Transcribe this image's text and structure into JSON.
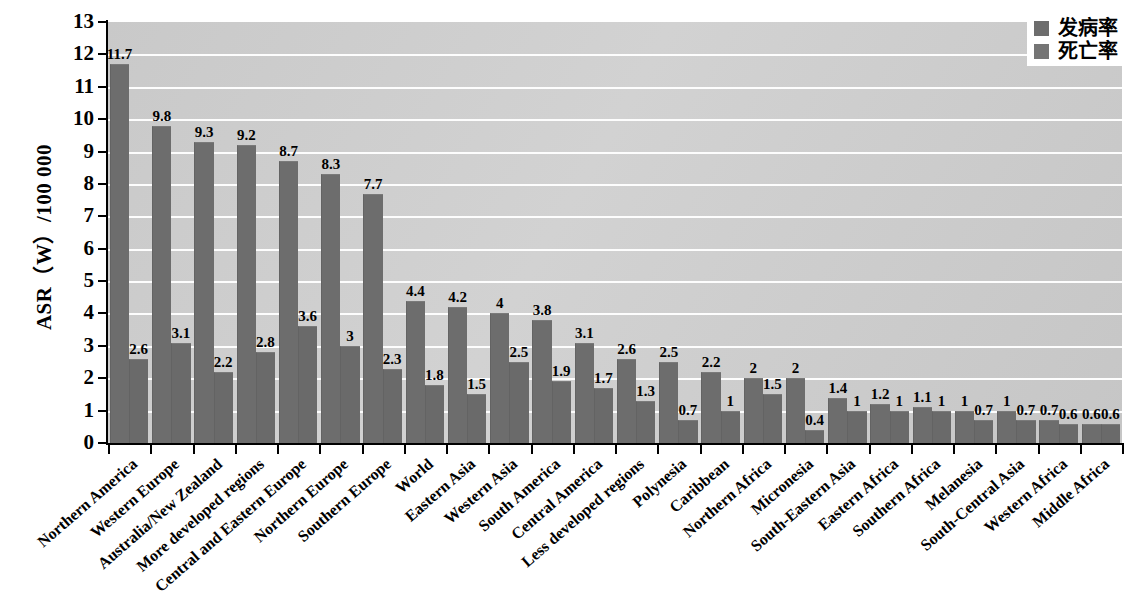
{
  "chart_data": {
    "type": "bar",
    "title": "",
    "xlabel": "",
    "ylabel": "ASR（W）/100 000",
    "ylim": [
      0,
      13
    ],
    "ytick_step": 1,
    "yticks": [
      0,
      1,
      2,
      3,
      4,
      5,
      6,
      7,
      8,
      9,
      10,
      11,
      12,
      13
    ],
    "grid": true,
    "legend_position": "top-right",
    "categories": [
      "Northern America",
      "Western Europe",
      "Australia/New Zealand",
      "More developed regions",
      "Central and Eastern Europe",
      "Northern Europe",
      "Southern Europe",
      "World",
      "Eastern Asia",
      "Western Asia",
      "South America",
      "Central America",
      "Less developed regions",
      "Polynesia",
      "Caribbean",
      "Northern Africa",
      "Micronesia",
      "South-Eastern Asia",
      "Eastern Africa",
      "Southern Africa",
      "Melanesia",
      "South-Central Asia",
      "Western Africa",
      "Middle Africa"
    ],
    "series": [
      {
        "name": "发病率",
        "color": "#6d6d6d",
        "values": [
          11.7,
          9.8,
          9.3,
          9.2,
          8.7,
          8.3,
          7.7,
          4.4,
          4.2,
          4,
          3.8,
          3.1,
          2.6,
          2.5,
          2.2,
          2,
          2,
          1.4,
          1.2,
          1.1,
          1,
          1,
          0.7,
          0.6
        ],
        "labels": [
          "11.7",
          "9.8",
          "9.3",
          "9.2",
          "8.7",
          "8.3",
          "7.7",
          "4.4",
          "4.2",
          "4",
          "3.8",
          "3.1",
          "2.6",
          "2.5",
          "2.2",
          "2",
          "2",
          "1.4",
          "1.2",
          "1.1",
          "1",
          "1",
          "0.7",
          "0.6"
        ]
      },
      {
        "name": "死亡率",
        "color": "#6a6a6a",
        "values": [
          2.6,
          3.1,
          2.2,
          2.8,
          3.6,
          3,
          2.3,
          1.8,
          1.5,
          2.5,
          1.9,
          1.7,
          1.3,
          0.7,
          1,
          1.5,
          0.4,
          1,
          1,
          1,
          0.7,
          0.7,
          0.6,
          0.6
        ],
        "labels": [
          "2.6",
          "3.1",
          "2.2",
          "2.8",
          "3.6",
          "3",
          "2.3",
          "1.8",
          "1.5",
          "2.5",
          "1.9",
          "1.7",
          "1.3",
          "0.7",
          "1",
          "1.5",
          "0.4",
          "1",
          "1",
          "1",
          "0.7",
          "0.7",
          "0.6",
          "0.6"
        ]
      }
    ]
  },
  "legend": {
    "items": [
      {
        "label": "发病率"
      },
      {
        "label": "死亡率"
      }
    ]
  }
}
